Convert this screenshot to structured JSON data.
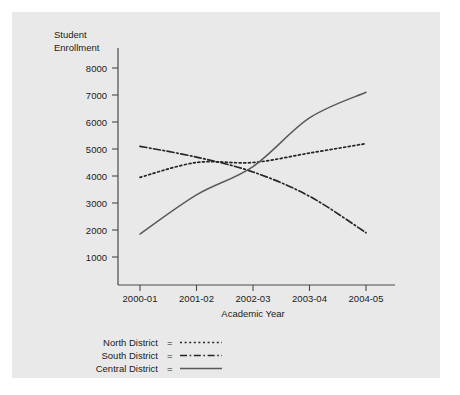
{
  "chart_data": {
    "type": "line",
    "title": "",
    "xlabel": "Academic Year",
    "ylabel": "Student Enrollment",
    "ylabel_line1": "Student",
    "ylabel_line2": "Enrollment",
    "categories": [
      "2000-01",
      "2001-02",
      "2002-03",
      "2003-04",
      "2004-05"
    ],
    "x": [
      2000,
      2001,
      2002,
      2003,
      2004
    ],
    "ylim": [
      0,
      8400
    ],
    "xlim": [
      -0.45,
      4.35
    ],
    "yticks": [
      1000,
      2000,
      3000,
      4000,
      5000,
      6000,
      7000,
      8000
    ],
    "ytick_labels": [
      "1000",
      "2000",
      "3000",
      "4000",
      "5000",
      "6000",
      "7000",
      "8000"
    ],
    "grid": false,
    "legend_position": "below-left",
    "series": [
      {
        "name": "North District",
        "values": [
          3950,
          4500,
          4500,
          4850,
          5200
        ],
        "style": "dotted",
        "color": "#262626"
      },
      {
        "name": "South District",
        "values": [
          5100,
          4700,
          4150,
          3250,
          1900
        ],
        "style": "dash-dot",
        "color": "#262626"
      },
      {
        "name": "Central District",
        "values": [
          1850,
          3300,
          4350,
          6150,
          7100
        ],
        "style": "solid",
        "color": "#5a5a5a"
      }
    ]
  },
  "legend": {
    "rows": [
      {
        "label": "North District",
        "equals": "=",
        "sample": "dotted"
      },
      {
        "label": "South District",
        "equals": "=",
        "sample": "dash-dot"
      },
      {
        "label": "Central District",
        "equals": "=",
        "sample": "solid"
      }
    ]
  }
}
